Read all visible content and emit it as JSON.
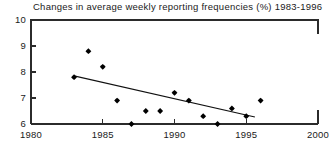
{
  "chart_data": {
    "type": "scatter",
    "title": "Changes in average weekly reporting frequencies (%) 1983-1996",
    "xlabel": "",
    "ylabel": "",
    "xlim": [
      1980,
      2000
    ],
    "ylim": [
      6,
      10
    ],
    "grid": false,
    "legend": "none",
    "x_ticks": [
      1980,
      1985,
      1990,
      1995,
      2000
    ],
    "x_tick_labels": [
      "1980",
      "1985",
      "1990",
      "1995",
      "2000"
    ],
    "y_ticks": [
      6,
      7,
      8,
      9,
      10
    ],
    "y_tick_labels": [
      "6",
      "7",
      "8",
      "9",
      "10"
    ],
    "series": [
      {
        "name": "Reporting frequency",
        "marker": "filled-diamond",
        "x": [
          1983,
          1984,
          1985,
          1986,
          1987,
          1988,
          1989,
          1990,
          1991,
          1992,
          1993,
          1994,
          1995,
          1996
        ],
        "values": [
          7.8,
          8.8,
          8.2,
          6.9,
          6.0,
          6.5,
          6.5,
          7.2,
          6.9,
          6.3,
          6.0,
          6.6,
          6.3,
          6.9
        ]
      }
    ],
    "trend_line": {
      "name": "linear fit",
      "x": [
        1983,
        1995.6
      ],
      "values": [
        7.85,
        6.27
      ]
    },
    "colors": {
      "marker": "#000000",
      "trend": "#111111",
      "axis": "#2b2b2b",
      "text": "#1a1a1a",
      "background": "#ffffff"
    }
  }
}
